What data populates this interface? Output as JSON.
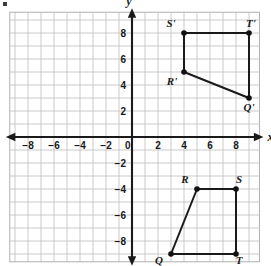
{
  "figure": {
    "axis_names": {
      "x": "x",
      "y": "y"
    },
    "origin_label": "0",
    "x_tick_labels": [
      "−8",
      "−6",
      "−4",
      "−2",
      "0",
      "2",
      "4",
      "6",
      "8"
    ],
    "y_tick_labels": [
      "8",
      "6",
      "4",
      "2",
      "−2",
      "−4",
      "−6",
      "−8"
    ],
    "grid": {
      "visible": true,
      "color": "#bdbdbd",
      "unit_px": 13
    },
    "axis_color": "#1a1a1a",
    "point_color": "#111111"
  },
  "chart_data": {
    "type": "scatter",
    "xlabel": "x",
    "ylabel": "y",
    "xlim": [
      -9.4,
      9.8
    ],
    "ylim": [
      -9.6,
      9.6
    ],
    "xticks": [
      -8,
      -6,
      -4,
      -2,
      0,
      2,
      4,
      6,
      8
    ],
    "yticks": [
      8,
      6,
      4,
      2,
      -2,
      -4,
      -6,
      -8
    ],
    "grid": true,
    "legend": "none",
    "series": [
      {
        "name": "Q'R'S'T'",
        "closed": true,
        "points": [
          {
            "label": "R'",
            "x": 4,
            "y": 5,
            "label_dx": -12,
            "label_dy": 13
          },
          {
            "label": "S'",
            "x": 4,
            "y": 8,
            "label_dx": -13,
            "label_dy": -6
          },
          {
            "label": "T'",
            "x": 9,
            "y": 8,
            "label_dx": 2,
            "label_dy": -6
          },
          {
            "label": "Q'",
            "x": 9,
            "y": 3,
            "label_dx": 0,
            "label_dy": 13
          }
        ],
        "edges": [
          [
            0,
            1
          ],
          [
            1,
            2
          ],
          [
            2,
            3
          ],
          [
            3,
            0
          ]
        ]
      },
      {
        "name": "QRST",
        "closed": true,
        "points": [
          {
            "label": "Q",
            "x": 3,
            "y": -9,
            "label_dx": -12,
            "label_dy": 10
          },
          {
            "label": "R",
            "x": 5,
            "y": -4,
            "label_dx": -12,
            "label_dy": -6
          },
          {
            "label": "S",
            "x": 8,
            "y": -4,
            "label_dx": 3,
            "label_dy": -6
          },
          {
            "label": "T",
            "x": 8,
            "y": -9,
            "label_dx": 3,
            "label_dy": 10
          }
        ],
        "edges": [
          [
            0,
            1
          ],
          [
            1,
            2
          ],
          [
            2,
            3
          ],
          [
            3,
            0
          ]
        ]
      }
    ]
  }
}
